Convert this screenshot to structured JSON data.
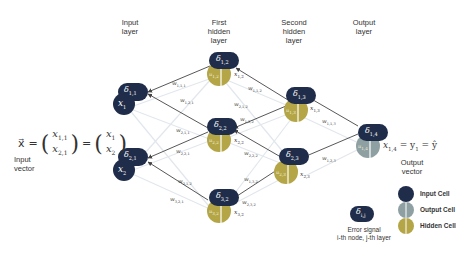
{
  "layers": {
    "input": "Input\nlayer",
    "hidden1": "First\nhidden\nlayer",
    "hidden2": "Second\nhidden\nlayer",
    "output": "Output\nlayer"
  },
  "colors": {
    "input_cell": "#1f2d4a",
    "output_cell": "#8fa0a3",
    "hidden_cell": "#b4a547",
    "edge_faint": "#e3e8ee",
    "arrow": "#444444"
  },
  "input_vector": {
    "equation_lhs": "x⃗ =",
    "matrix_1": [
      "x",
      "1,1",
      "x",
      "2,1"
    ],
    "matrix_2": [
      "x",
      "1",
      "x",
      "2"
    ],
    "label_line1": "Input",
    "label_line2": "vector"
  },
  "output_vector": {
    "equation": "x",
    "equation_sub": "1,4",
    "equation_rest": " = y",
    "equation_rest_sub": "1",
    "equation_end": " = ŷ",
    "label_line1": "Output",
    "label_line2": "vector"
  },
  "nodes": {
    "n11": {
      "delta": "δ",
      "delta_sub": "1,1",
      "x": "x",
      "x_sub": "1"
    },
    "n21": {
      "delta": "δ",
      "delta_sub": "2,1",
      "x": "x",
      "x_sub": "2"
    },
    "n12": {
      "delta": "δ",
      "delta_sub": "1,2",
      "u": "u",
      "u_sub": "1,2",
      "x": "x",
      "x_sub": "1,2"
    },
    "n22": {
      "delta": "δ",
      "delta_sub": "2,2",
      "u": "u",
      "u_sub": "2,2",
      "x": "x",
      "x_sub": "2,2"
    },
    "n32": {
      "delta": "δ",
      "delta_sub": "3,2",
      "u": "u",
      "u_sub": "3,2",
      "x": "x",
      "x_sub": "3,2"
    },
    "n13": {
      "delta": "δ",
      "delta_sub": "1,3",
      "u": "u",
      "u_sub": "1,3",
      "x": "x",
      "x_sub": "1,3"
    },
    "n23": {
      "delta": "δ",
      "delta_sub": "2,3",
      "u": "u",
      "u_sub": "2,3",
      "x": "x",
      "x_sub": "2,3"
    },
    "n14": {
      "delta": "δ",
      "delta_sub": "1,4",
      "u": "u",
      "u_sub": "1,4"
    }
  },
  "weights": {
    "w111": {
      "w": "w",
      "sub": "1,1,1"
    },
    "w121": {
      "w": "w",
      "sub": "1,2,1"
    },
    "w211": {
      "w": "w",
      "sub": "2,1,1"
    },
    "w221": {
      "w": "w",
      "sub": "2,2,1"
    },
    "w312": {
      "w": "w",
      "sub": "3,1,2"
    },
    "w321": {
      "w": "w",
      "sub": "3,2,1"
    },
    "w112": {
      "w": "w",
      "sub": "1,1,2"
    },
    "w212": {
      "w": "w",
      "sub": "2,1,2"
    },
    "w122": {
      "w": "w",
      "sub": "1,2,2"
    },
    "w222": {
      "w": "w",
      "sub": "2,2,2"
    },
    "w132": {
      "w": "w",
      "sub": "1,3,2"
    },
    "w232": {
      "w": "w",
      "sub": "2,3,2"
    },
    "w113": {
      "w": "w",
      "sub": "1,1,3"
    },
    "w123": {
      "w": "w",
      "sub": "1,2,3"
    }
  },
  "legend": {
    "input_cell": "Input Cell",
    "output_cell": "Output Cell",
    "hidden_cell": "Hidden Cell",
    "error_symbol": "δ",
    "error_symbol_sub": "i,j",
    "error_line1": "Error signal",
    "error_line2": "i-th node, j-th layer"
  }
}
